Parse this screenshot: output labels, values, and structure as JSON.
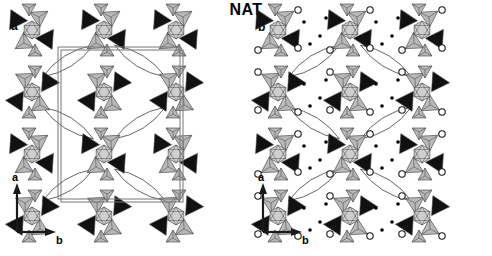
{
  "figure": {
    "title": "NAT",
    "title_meaning": "natrolite-type zeolite framework",
    "background_color": "#ffffff",
    "panels": [
      {
        "id": "a",
        "label": "a",
        "description": "Natrolite framework projected down c, showing corner-linked tetrahedra and the unit cell outline",
        "axes": {
          "vertical_label": "a",
          "horizontal_label": "b"
        },
        "unit_cell_shown": true
      },
      {
        "id": "b",
        "label": "b",
        "description": "Same framework with extra-framework cations (filled dots) and water molecules (open circles)",
        "axes": {
          "vertical_label": "a",
          "horizontal_label": "b"
        },
        "unit_cell_shown": false
      }
    ]
  },
  "legend_semantics": {
    "dark_tetrahedron": "T-site tetrahedron shaded dark (black)",
    "light_tetrahedron": "T-site tetrahedron shaded light (grey)",
    "open_circle": "water molecule",
    "filled_dot": "extra-framework cation (Na)",
    "white_lens": "open channel / pore viewed down c"
  },
  "colors": {
    "dark_fill": "#111111",
    "light_fill": "#b9b9b9",
    "mid_fill": "#cfcfcf",
    "edge": "#3a3a3a",
    "cell_line": "#777777",
    "text": "#000000",
    "circle_fill": "#ffffff",
    "dot_fill": "#000000"
  },
  "chart_data": {
    "type": "diagram",
    "title": "NAT",
    "panel_count": 2,
    "axis_vertical": "a",
    "axis_horizontal": "b",
    "cluster_lattice": {
      "columns_x": [
        32,
        104,
        176
      ],
      "rows_y": [
        30,
        92,
        154,
        216
      ],
      "row_offset_x": 0
    },
    "unit_cell_box": {
      "x": 58,
      "y": 47,
      "width": 122,
      "height": 152,
      "double_line_gap": 3
    },
    "water_circle_radius": 3.2,
    "cation_dot_radius": 1.8
  }
}
